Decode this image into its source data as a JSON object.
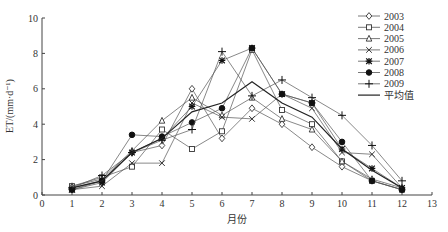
{
  "chart_data": {
    "type": "line",
    "title": "",
    "xlabel": "月份",
    "ylabel": "ET/(mm·d⁻¹)",
    "xlim": [
      0,
      13
    ],
    "ylim": [
      0,
      10
    ],
    "x_ticks": [
      0,
      1,
      2,
      3,
      4,
      5,
      6,
      7,
      8,
      9,
      10,
      11,
      12,
      13
    ],
    "y_ticks": [
      0,
      2,
      4,
      6,
      8,
      10
    ],
    "grid": false,
    "legend_position": "top-right",
    "x": [
      1,
      2,
      3,
      4,
      5,
      6,
      7,
      8,
      9,
      10,
      11,
      12
    ],
    "series": [
      {
        "name": "2003",
        "marker": "diamond-open",
        "values": [
          0.4,
          0.8,
          2.4,
          2.8,
          6.0,
          3.2,
          4.9,
          4.0,
          2.7,
          1.6,
          0.8,
          0.3
        ]
      },
      {
        "name": "2004",
        "marker": "square-open",
        "values": [
          0.5,
          1.0,
          1.6,
          3.7,
          2.6,
          3.6,
          8.2,
          4.8,
          4.0,
          1.9,
          0.8,
          0.3
        ]
      },
      {
        "name": "2005",
        "marker": "triangle-open",
        "values": [
          0.5,
          0.9,
          2.5,
          4.2,
          5.5,
          4.5,
          5.5,
          4.3,
          3.7,
          1.9,
          0.9,
          0.4
        ]
      },
      {
        "name": "2006",
        "marker": "x",
        "values": [
          0.3,
          0.5,
          1.8,
          1.8,
          5.2,
          4.4,
          4.3,
          5.7,
          4.9,
          2.4,
          2.3,
          0.4
        ]
      },
      {
        "name": "2007",
        "marker": "star",
        "values": [
          0.3,
          0.7,
          2.4,
          3.2,
          5.0,
          7.6,
          8.3,
          5.7,
          5.2,
          2.6,
          1.5,
          0.4
        ]
      },
      {
        "name": "2008",
        "marker": "circle-filled",
        "values": [
          0.3,
          0.8,
          3.4,
          3.3,
          4.1,
          4.9,
          8.3,
          5.7,
          5.2,
          3.0,
          0.8,
          0.3
        ]
      },
      {
        "name": "2009",
        "marker": "plus",
        "values": [
          0.4,
          1.1,
          2.4,
          3.1,
          3.7,
          8.1,
          5.6,
          6.5,
          5.5,
          4.5,
          2.8,
          0.8
        ]
      },
      {
        "name": "平均值",
        "marker": "none",
        "values": [
          0.4,
          0.8,
          2.4,
          3.2,
          4.7,
          5.2,
          6.4,
          5.2,
          4.4,
          2.6,
          1.4,
          0.4
        ]
      }
    ]
  },
  "axes": {
    "xlabel": "月份",
    "ylabel": "ET/(mm·d⁻¹)"
  },
  "legend": {
    "items": [
      "2003",
      "2004",
      "2005",
      "2006",
      "2007",
      "2008",
      "2009",
      "平均值"
    ]
  },
  "colors": {
    "line": "#555555",
    "mean_line": "#222222",
    "axis": "#444444"
  }
}
